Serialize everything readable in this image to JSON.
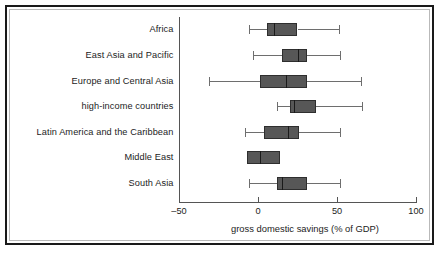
{
  "chart_data": {
    "type": "box",
    "title": "",
    "xlabel": "gross domestic savings (% of GDP)",
    "ylabel": "",
    "xlim": [
      -50,
      100
    ],
    "xticks": [
      -50,
      0,
      50,
      100
    ],
    "xticklabels": [
      "–50",
      "0",
      "50",
      "100"
    ],
    "grid": false,
    "legend": false,
    "orientation": "horizontal",
    "categories": [
      "Africa",
      "East Asia and Pacific",
      "Europe and Central Asia",
      "high-income countries",
      "Latin America and the Caribbean",
      "Middle East",
      "South Asia"
    ],
    "boxes": [
      {
        "category": "Africa",
        "whisker_low": -6,
        "q1": 6,
        "median": 10,
        "q3": 25,
        "whisker_high": 51
      },
      {
        "category": "East Asia and Pacific",
        "whisker_low": -3,
        "q1": 15,
        "median": 25,
        "q3": 31,
        "whisker_high": 52
      },
      {
        "category": "Europe and Central Asia",
        "whisker_low": -31,
        "q1": 1,
        "median": 18,
        "q3": 31,
        "whisker_high": 65
      },
      {
        "category": "high-income countries",
        "whisker_low": 12,
        "q1": 20,
        "median": 23,
        "q3": 37,
        "whisker_high": 66
      },
      {
        "category": "Latin America and the Caribbean",
        "whisker_low": -8,
        "q1": 4,
        "median": 19,
        "q3": 26,
        "whisker_high": 52
      },
      {
        "category": "Middle East",
        "whisker_low": null,
        "q1": -7,
        "median": 1,
        "q3": 14,
        "whisker_high": null
      },
      {
        "category": "South Asia",
        "whisker_low": -6,
        "q1": 12,
        "median": 15,
        "q3": 31,
        "whisker_high": 52
      }
    ]
  },
  "colors": {
    "box_fill": "#575757",
    "box_edge": "#2e2e2e",
    "median": "#1a1a1a",
    "whisker": "#6e6e6e",
    "axis": "#555555",
    "text": "#1c1c1c",
    "frame_outer": "#1a1a1a",
    "frame_inner": "#b9b9b9",
    "background": "#ffffff"
  }
}
